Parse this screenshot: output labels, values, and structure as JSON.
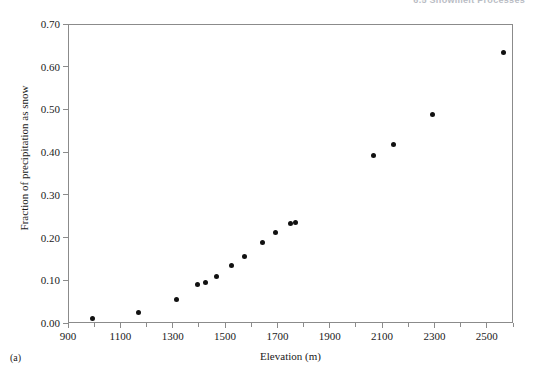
{
  "header": {
    "running_head": "6.5  Snowmelt Processes"
  },
  "figure": {
    "panel_label": "(a)"
  },
  "chart_data": {
    "type": "scatter",
    "title": "",
    "xlabel": "Elevation (m)",
    "ylabel": "Fraction of precipitation as snow",
    "xlim": [
      900,
      2600
    ],
    "ylim": [
      0.0,
      0.7
    ],
    "grid": false,
    "legend": null,
    "marker": {
      "shape": "circle",
      "color": "#111111",
      "size_px": 5
    },
    "axis_color": "#8b8b8b",
    "xticks": [
      900,
      1100,
      1300,
      1500,
      1700,
      1900,
      2100,
      2300,
      2500
    ],
    "xtick_labels": [
      "900",
      "1100",
      "1300",
      "1500",
      "1700",
      "1900",
      "2100",
      "2300",
      "2500"
    ],
    "xminor_ticks": [
      1000,
      1200,
      1400,
      1600,
      1800,
      2000,
      2200,
      2400,
      2600
    ],
    "yticks": [
      0.0,
      0.1,
      0.2,
      0.3,
      0.4,
      0.5,
      0.6,
      0.7
    ],
    "ytick_labels": [
      "0.00",
      "0.10",
      "0.20",
      "0.30",
      "0.40",
      "0.50",
      "0.60",
      "0.70"
    ],
    "x": [
      990,
      1165,
      1310,
      1390,
      1420,
      1465,
      1520,
      1570,
      1640,
      1690,
      1745,
      1765,
      2065,
      2140,
      2290,
      2560
    ],
    "y": [
      0.013,
      0.028,
      0.058,
      0.093,
      0.098,
      0.112,
      0.137,
      0.157,
      0.19,
      0.215,
      0.236,
      0.238,
      0.394,
      0.42,
      0.49,
      0.635
    ],
    "points": [
      {
        "x": 990,
        "y": 0.013
      },
      {
        "x": 1165,
        "y": 0.028
      },
      {
        "x": 1310,
        "y": 0.058
      },
      {
        "x": 1390,
        "y": 0.093
      },
      {
        "x": 1420,
        "y": 0.098
      },
      {
        "x": 1465,
        "y": 0.112
      },
      {
        "x": 1520,
        "y": 0.137
      },
      {
        "x": 1570,
        "y": 0.157
      },
      {
        "x": 1640,
        "y": 0.19
      },
      {
        "x": 1690,
        "y": 0.215
      },
      {
        "x": 1745,
        "y": 0.236
      },
      {
        "x": 1765,
        "y": 0.238
      },
      {
        "x": 2065,
        "y": 0.394
      },
      {
        "x": 2140,
        "y": 0.42
      },
      {
        "x": 2290,
        "y": 0.49
      },
      {
        "x": 2560,
        "y": 0.635
      }
    ]
  }
}
